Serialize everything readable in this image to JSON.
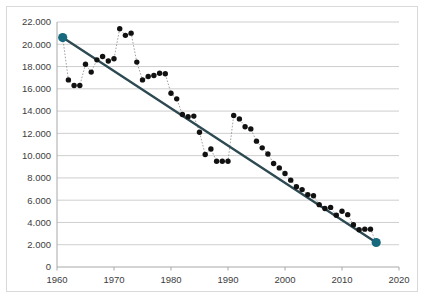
{
  "chart_data": {
    "type": "scatter",
    "title": "",
    "subtitle": "",
    "xlabel": "",
    "ylabel": "",
    "xlim": [
      1960,
      2020
    ],
    "ylim": [
      0,
      22000
    ],
    "grid": true,
    "legend": "none",
    "number_format": "european-thousands-dot",
    "x_ticks": [
      1960,
      1970,
      1980,
      1990,
      2000,
      2010,
      2020
    ],
    "x_tick_labels": [
      "1960",
      "1970",
      "1980",
      "1990",
      "2000",
      "2010",
      "2020"
    ],
    "y_ticks": [
      0,
      2000,
      4000,
      6000,
      8000,
      10000,
      12000,
      14000,
      16000,
      18000,
      20000,
      22000
    ],
    "y_tick_labels": [
      "0",
      "2.000",
      "4.000",
      "6.000",
      "8.000",
      "10.000",
      "12.000",
      "14.000",
      "16.000",
      "18.000",
      "20.000",
      "22.000"
    ],
    "series": [
      {
        "name": "observations",
        "type": "scatter",
        "marker": "circle",
        "marker_color": "#111111",
        "connector": "dotted",
        "x": [
          1961,
          1962,
          1963,
          1964,
          1965,
          1966,
          1967,
          1968,
          1969,
          1970,
          1971,
          1972,
          1973,
          1974,
          1975,
          1976,
          1977,
          1978,
          1979,
          1980,
          1981,
          1982,
          1983,
          1984,
          1985,
          1986,
          1987,
          1988,
          1989,
          1990,
          1991,
          1992,
          1993,
          1994,
          1995,
          1996,
          1997,
          1998,
          1999,
          2000,
          2001,
          2002,
          2003,
          2004,
          2005,
          2006,
          2007,
          2008,
          2009,
          2010,
          2011,
          2012,
          2013,
          2014,
          2015,
          2016
        ],
        "y": [
          20600,
          16800,
          16300,
          16300,
          18200,
          17500,
          18600,
          18900,
          18500,
          18700,
          21400,
          20800,
          21000,
          18400,
          16800,
          17100,
          17200,
          17400,
          17350,
          15600,
          15100,
          13700,
          13500,
          13550,
          12100,
          10100,
          10600,
          9500,
          9500,
          9500,
          13600,
          13300,
          12600,
          12400,
          11300,
          10700,
          10150,
          9300,
          8900,
          8400,
          7800,
          7200,
          6950,
          6500,
          6400,
          5600,
          5250,
          5350,
          4650,
          5000,
          4700,
          3800,
          3350,
          3400,
          3400,
          2200
        ]
      },
      {
        "name": "trend",
        "type": "line",
        "line_color": "#2d4a52",
        "x": [
          1961,
          2016
        ],
        "y": [
          20600,
          2200
        ],
        "endpoints": [
          {
            "x": 1961,
            "y": 20600,
            "color": "#17697d"
          },
          {
            "x": 2016,
            "y": 2200,
            "color": "#17697d"
          }
        ]
      }
    ],
    "colors": {
      "trend_line": "#2d4a52",
      "endpoint_marker": "#17697d",
      "data_marker": "#111111",
      "gridline": "#c8c8c8",
      "axis": "#a8a8a8",
      "tick_text": "#3d3d3d",
      "background": "#ffffff",
      "frame": "#d9d9d9"
    }
  }
}
